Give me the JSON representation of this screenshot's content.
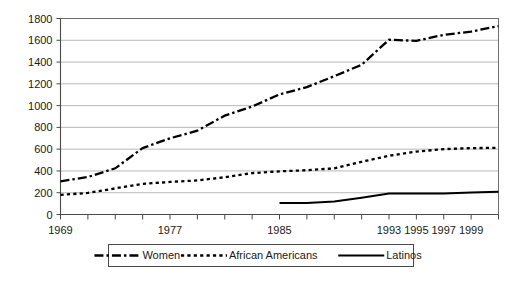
{
  "chart_data": {
    "type": "line",
    "title": "",
    "subtitle": "",
    "xlabel": "",
    "ylabel": "",
    "xlim": [
      1969,
      2001
    ],
    "ylim": [
      0,
      1800
    ],
    "y_ticks": [
      0,
      200,
      400,
      600,
      800,
      1000,
      1200,
      1400,
      1600,
      1800
    ],
    "x_ticks": [
      1969,
      1971,
      1973,
      1975,
      1977,
      1979,
      1981,
      1983,
      1985,
      1987,
      1989,
      1991,
      1993,
      1995,
      1997,
      1999,
      2001
    ],
    "x_tick_labels": [
      "1969",
      "",
      "",
      "",
      "1977",
      "",
      "",
      "",
      "1985",
      "",
      "",
      "",
      "1993",
      "1995",
      "1997",
      "1999",
      ""
    ],
    "grid": "horizontal",
    "legend_position": "bottom",
    "x": [
      1969,
      1971,
      1973,
      1975,
      1977,
      1979,
      1981,
      1983,
      1985,
      1987,
      1989,
      1991,
      1993,
      1995,
      1997,
      1999,
      2001
    ],
    "series": [
      {
        "name": "Women",
        "style": "dash-dot",
        "color": "#000000",
        "values": [
          305,
          344,
          424,
          610,
          700,
          770,
          908,
          991,
          1103,
          1170,
          1270,
          1375,
          1605,
          1595,
          1650,
          1680,
          1730
        ]
      },
      {
        "name": "African Americans",
        "style": "dotted",
        "color": "#000000",
        "values": [
          180,
          198,
          240,
          281,
          299,
          313,
          342,
          380,
          396,
          407,
          424,
          484,
          540,
          578,
          600,
          610,
          612
        ]
      },
      {
        "name": "Latinos",
        "style": "solid",
        "color": "#000000",
        "values": [
          null,
          null,
          null,
          null,
          null,
          null,
          null,
          null,
          105,
          105,
          120,
          154,
          192,
          192,
          194,
          202,
          210
        ]
      }
    ]
  },
  "axis": {
    "y_labels": [
      "1800",
      "1600",
      "1400",
      "1200",
      "1000",
      "800",
      "600",
      "400",
      "200",
      "0"
    ],
    "x_labels": [
      "1969",
      "1977",
      "1985",
      "1993",
      "1995",
      "1997",
      "1999"
    ]
  },
  "legend": {
    "items": [
      {
        "label": "Women",
        "style": "dash-dot"
      },
      {
        "label": "African Americans",
        "style": "dotted"
      },
      {
        "label": "Latinos",
        "style": "solid"
      }
    ]
  }
}
